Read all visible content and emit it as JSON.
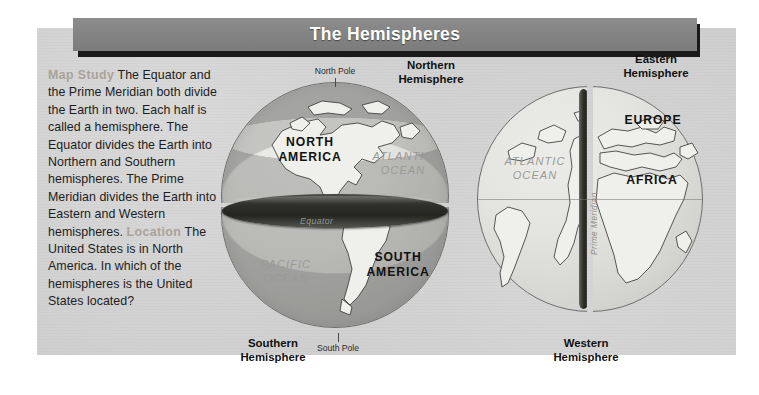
{
  "title": {
    "text": "The Hemispheres"
  },
  "study": {
    "kicker_1": "Map Study",
    "body_1": "The Equator and the Prime Meridian both divide the Earth in two. Each half is called a hemisphere. The Equator divides the Earth into Northern and Southern hemispheres. The Prime Meridian divides the Earth into Eastern and Western hemispheres.",
    "kicker_2": "Location",
    "body_2": "The United States is in North America. In which of the hemispheres is the United States located?"
  },
  "globe_ns": {
    "hemisphere_top": "Northern\nHemisphere",
    "hemisphere_bottom": "Southern\nHemisphere",
    "pole_top": "North Pole",
    "pole_bottom": "South Pole",
    "continent_top": "NORTH\nAMERICA",
    "continent_bottom": "SOUTH\nAMERICA",
    "ocean_top": "ATLANTIC\nOCEAN",
    "ocean_bottom": "PACIFIC\nOCEAN",
    "divider_label": "Equator"
  },
  "globe_ew": {
    "hemisphere_right": "Eastern\nHemisphere",
    "hemisphere_left": "Western\nHemisphere",
    "ocean_left": "ATLANTIC\nOCEAN",
    "continent_right_1": "EUROPE",
    "continent_right_2": "AFRICA",
    "divider_label": "Prime Meridian"
  },
  "colors": {
    "panel_bg": "#cfcfcf",
    "title_bar": "#828282",
    "title_text": "#ffffff",
    "kicker": "#a9a399",
    "body_text": "#1d1d1d",
    "ocean_label": "#9a9a96",
    "land_fill": "#efefeb",
    "cut_face": "#2e2e2b"
  }
}
